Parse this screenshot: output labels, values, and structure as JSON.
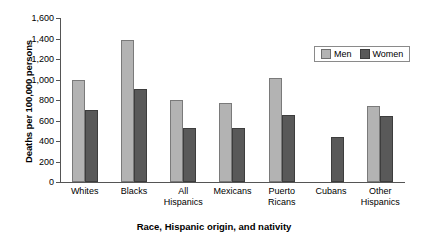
{
  "chart_data": {
    "type": "bar",
    "title": "",
    "xlabel": "Race, Hispanic origin, and nativity",
    "ylabel": "Deaths per 100,000 persons",
    "ylim": [
      0,
      1600
    ],
    "ytick_values": [
      0,
      200,
      400,
      600,
      800,
      1000,
      1200,
      1400,
      1600
    ],
    "ytick_labels": [
      "0",
      "200",
      "400",
      "600",
      "800",
      "1,000",
      "1,200",
      "1,400",
      "1,600"
    ],
    "grid": false,
    "legend_position": "top-right",
    "categories": [
      [
        "Whites"
      ],
      [
        "Blacks"
      ],
      [
        "All",
        "Hispanics"
      ],
      [
        "Mexicans"
      ],
      [
        "Puerto",
        "Ricans"
      ],
      [
        "Cubans"
      ],
      [
        "Other",
        "Hispanics"
      ]
    ],
    "series": [
      {
        "name": "Men",
        "color": "#b3b3b3",
        "values": [
          1000,
          1390,
          800,
          775,
          1010,
          null,
          740
        ]
      },
      {
        "name": "Women",
        "color": "#595959",
        "values": [
          700,
          910,
          530,
          525,
          650,
          440,
          640
        ]
      }
    ]
  },
  "legend": {
    "men_label": "Men",
    "women_label": "Women"
  },
  "axis": {
    "y_title": "Deaths per 100,000 persons",
    "x_title": "Race, Hispanic origin, and nativity"
  }
}
